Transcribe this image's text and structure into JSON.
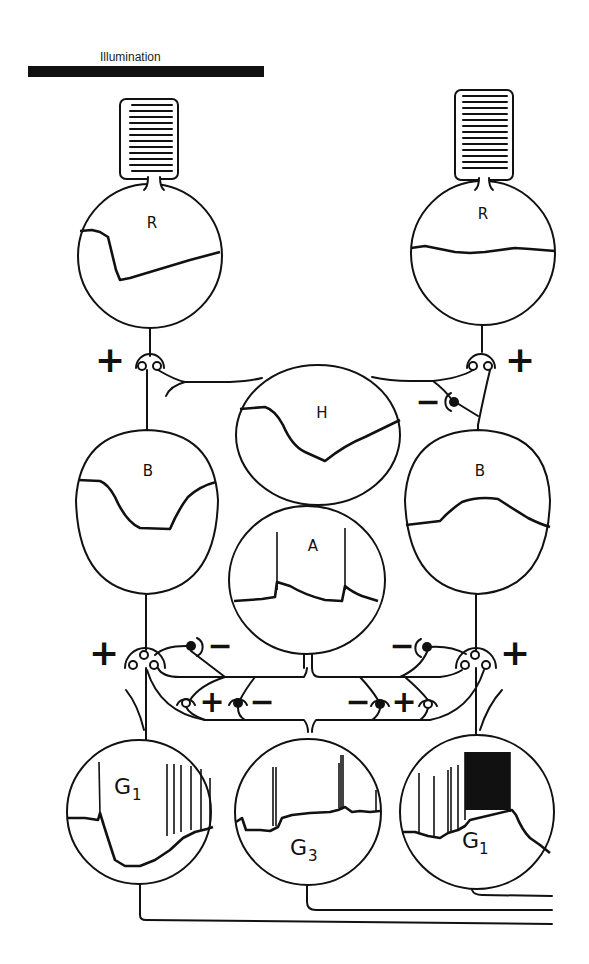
{
  "title": "Illumination",
  "illumination_bar": {
    "label": "Illumination",
    "color": "#111111"
  },
  "cells": {
    "receptor_left": {
      "label": "R",
      "response": "hyperpolarizing step, slow recovery"
    },
    "receptor_right": {
      "label": "R",
      "response": "flat (unilluminated)"
    },
    "horizontal": {
      "label": "H",
      "response": "hyperpolarizing"
    },
    "bipolar_left": {
      "label": "B",
      "response": "hyperpolarizing"
    },
    "bipolar_right": {
      "label": "B",
      "response": "depolarizing"
    },
    "amacrine": {
      "label": "A",
      "response": "transient on-off"
    },
    "ganglion_left": {
      "label": "G",
      "subscript": "1",
      "response": "off-type spiking"
    },
    "ganglion_center": {
      "label": "G",
      "subscript": "3",
      "response": "transient on-off spiking"
    },
    "ganglion_right": {
      "label": "G",
      "subscript": "1",
      "response": "on-type burst"
    }
  },
  "synapse_signs": {
    "r_left_to_b": "+",
    "r_right_to_b": "+",
    "h_to_b_right": "−",
    "b_left_ribbon": "+",
    "b_right_ribbon": "+",
    "a_left_upper": "−",
    "a_right_upper": "−",
    "a_left_lower_excit": "+",
    "a_left_lower_inhib": "−",
    "a_right_lower_inhib": "−",
    "a_right_lower_excit": "+"
  },
  "colors": {
    "ink": "#111111",
    "background": "#ffffff"
  }
}
